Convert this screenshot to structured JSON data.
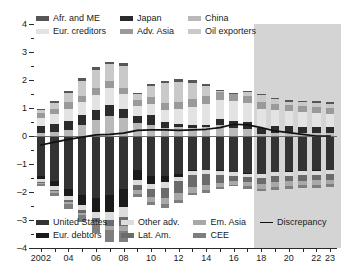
{
  "chart_data": {
    "type": "bar",
    "title": "",
    "subtitle": "",
    "xlabel": "",
    "ylabel": "",
    "grid": false,
    "stacked": true,
    "ylim": [
      -4,
      4
    ],
    "yticks": [
      -4,
      -3,
      -2,
      -1,
      0,
      1,
      2,
      3,
      4
    ],
    "ytick_labels": [
      "–4",
      "–3",
      "–2",
      "–1",
      "0",
      "1",
      "2",
      "3",
      "4"
    ],
    "yminor_ticks": [
      -3.5,
      -2.5,
      -1.5,
      -0.5,
      0.5,
      1.5,
      2.5,
      3.5
    ],
    "x": [
      2002,
      2003,
      2004,
      2005,
      2006,
      2007,
      2008,
      2009,
      2010,
      2011,
      2012,
      2013,
      2014,
      2015,
      2016,
      2017,
      2018,
      2019,
      2020,
      2021,
      2022,
      2023
    ],
    "xtick_labels": [
      "2002",
      "",
      "04",
      "",
      "06",
      "",
      "08",
      "",
      "10",
      "",
      "12",
      "",
      "14",
      "",
      "16",
      "",
      "18",
      "",
      "20",
      "",
      "22",
      "23"
    ],
    "forecast_start": 2017.5,
    "forecast_label": "",
    "series": [
      {
        "name": "China",
        "key": "china",
        "color": "#b9b9b9",
        "side": "positive",
        "values": [
          0.1,
          0.15,
          0.2,
          0.38,
          0.58,
          0.7,
          0.65,
          0.45,
          0.4,
          0.28,
          0.32,
          0.3,
          0.32,
          0.38,
          0.28,
          0.24,
          0.08,
          0.12,
          0.14,
          0.12,
          0.1,
          0.1
        ]
      },
      {
        "name": "Japan",
        "key": "japan",
        "color": "#2b2b2b",
        "side": "positive",
        "values": [
          0.25,
          0.28,
          0.35,
          0.36,
          0.36,
          0.42,
          0.32,
          0.25,
          0.34,
          0.22,
          0.12,
          0.09,
          0.08,
          0.22,
          0.24,
          0.26,
          0.22,
          0.22,
          0.22,
          0.21,
          0.21,
          0.21
        ]
      },
      {
        "name": "Eur. creditors",
        "key": "eur_creditors",
        "color": "#e3e3e3",
        "side": "positive",
        "values": [
          0.28,
          0.34,
          0.42,
          0.46,
          0.52,
          0.58,
          0.52,
          0.36,
          0.4,
          0.44,
          0.52,
          0.66,
          0.74,
          0.7,
          0.72,
          0.68,
          0.66,
          0.58,
          0.54,
          0.52,
          0.5,
          0.48
        ]
      },
      {
        "name": "Adv. Asia",
        "key": "adv_asia",
        "color": "#9a9a9a",
        "side": "positive",
        "values": [
          0.18,
          0.2,
          0.24,
          0.22,
          0.24,
          0.26,
          0.22,
          0.22,
          0.26,
          0.24,
          0.24,
          0.26,
          0.28,
          0.28,
          0.26,
          0.26,
          0.24,
          0.22,
          0.22,
          0.22,
          0.22,
          0.22
        ]
      },
      {
        "name": "Oil exporters",
        "key": "oil_exporters",
        "color": "#c9c9c9",
        "side": "positive",
        "values": [
          0.12,
          0.22,
          0.34,
          0.56,
          0.66,
          0.6,
          0.78,
          0.22,
          0.38,
          0.72,
          0.74,
          0.6,
          0.38,
          0.04,
          0.02,
          0.12,
          0.26,
          0.18,
          0.1,
          0.14,
          0.16,
          0.14
        ]
      },
      {
        "name": "Afr. and ME",
        "key": "afr_me",
        "color": "#565656",
        "side": "positive",
        "values": [
          0.04,
          0.05,
          0.06,
          0.08,
          0.09,
          0.1,
          0.1,
          0.05,
          0.06,
          0.08,
          0.09,
          0.08,
          0.06,
          0.04,
          0.03,
          0.04,
          0.05,
          0.05,
          0.05,
          0.05,
          0.05,
          0.05
        ]
      },
      {
        "name": "United States",
        "key": "united_states",
        "color": "#333333",
        "side": "negative",
        "values": [
          -1.42,
          -1.62,
          -1.88,
          -2.1,
          -2.22,
          -2.1,
          -1.9,
          -1.22,
          -1.42,
          -1.44,
          -1.36,
          -1.22,
          -1.2,
          -1.22,
          -1.28,
          -1.32,
          -1.34,
          -1.28,
          -1.26,
          -1.24,
          -1.22,
          -1.2
        ]
      },
      {
        "name": "Eur. debtors",
        "key": "eur_debtors",
        "color": "#1a1a1a",
        "side": "negative",
        "values": [
          -0.12,
          -0.18,
          -0.26,
          -0.36,
          -0.48,
          -0.6,
          -0.64,
          -0.36,
          -0.28,
          -0.22,
          -0.1,
          -0.02,
          -0.02,
          -0.02,
          -0.02,
          -0.02,
          -0.02,
          -0.02,
          -0.02,
          -0.02,
          -0.02,
          -0.02
        ]
      },
      {
        "name": "Other adv.",
        "key": "other_adv",
        "color": "#dcdcdc",
        "side": "negative",
        "values": [
          -0.1,
          -0.12,
          -0.14,
          -0.18,
          -0.22,
          -0.3,
          -0.34,
          -0.18,
          -0.18,
          -0.18,
          -0.16,
          -0.14,
          -0.14,
          -0.14,
          -0.14,
          -0.14,
          -0.14,
          -0.14,
          -0.14,
          -0.14,
          -0.14,
          -0.14
        ]
      },
      {
        "name": "Lat. Am.",
        "key": "lat_am",
        "color": "#6b6b6b",
        "side": "negative",
        "values": [
          -0.04,
          -0.06,
          -0.08,
          -0.1,
          -0.14,
          -0.22,
          -0.32,
          -0.18,
          -0.3,
          -0.38,
          -0.42,
          -0.44,
          -0.4,
          -0.3,
          -0.18,
          -0.18,
          -0.22,
          -0.22,
          -0.2,
          -0.2,
          -0.2,
          -0.2
        ]
      },
      {
        "name": "Em. Asia",
        "key": "em_asia",
        "color": "#a8a8a8",
        "side": "negative",
        "values": [
          -0.04,
          -0.05,
          -0.06,
          -0.08,
          -0.1,
          -0.14,
          -0.2,
          -0.12,
          -0.16,
          -0.22,
          -0.26,
          -0.22,
          -0.18,
          -0.14,
          -0.12,
          -0.14,
          -0.16,
          -0.16,
          -0.16,
          -0.16,
          -0.16,
          -0.16
        ]
      },
      {
        "name": "CEE",
        "key": "cee",
        "color": "#7e7e7e",
        "side": "negative",
        "values": [
          -0.08,
          -0.12,
          -0.18,
          -0.24,
          -0.32,
          -0.44,
          -0.4,
          -0.12,
          -0.12,
          -0.14,
          -0.1,
          -0.08,
          -0.08,
          -0.06,
          -0.06,
          -0.08,
          -0.1,
          -0.1,
          -0.1,
          -0.1,
          -0.1,
          -0.1
        ]
      }
    ],
    "discrepancy_line": {
      "name": "Discrepancy",
      "color": "#111111",
      "values": [
        -0.32,
        -0.22,
        -0.12,
        -0.04,
        0.04,
        0.06,
        0.1,
        0.2,
        0.22,
        0.22,
        0.2,
        0.22,
        0.24,
        0.3,
        0.42,
        0.4,
        0.3,
        0.18,
        0.12,
        0.06,
        0.0,
        0.0
      ]
    }
  },
  "legend_top": {
    "items": [
      {
        "label": "Afr. and ME",
        "color": "#565656",
        "kind": "swatch"
      },
      {
        "label": "Japan",
        "color": "#2b2b2b",
        "kind": "swatch"
      },
      {
        "label": "China",
        "color": "#b9b9b9",
        "kind": "swatch"
      },
      {
        "label": "Eur. creditors",
        "color": "#e3e3e3",
        "kind": "swatch"
      },
      {
        "label": "Adv. Asia",
        "color": "#9a9a9a",
        "kind": "swatch"
      },
      {
        "label": "Oil exporters",
        "color": "#c9c9c9",
        "kind": "swatch"
      }
    ]
  },
  "legend_bottom": {
    "items": [
      {
        "label": "United States",
        "color": "#333333",
        "kind": "swatch"
      },
      {
        "label": "Other adv.",
        "color": "#dcdcdc",
        "kind": "swatch"
      },
      {
        "label": "Em. Asia",
        "color": "#a8a8a8",
        "kind": "swatch"
      },
      {
        "label": "Discrepancy",
        "color": "#111111",
        "kind": "line"
      },
      {
        "label": "Eur. debtors",
        "color": "#1a1a1a",
        "kind": "swatch"
      },
      {
        "label": "Lat. Am.",
        "color": "#6b6b6b",
        "kind": "swatch"
      },
      {
        "label": "CEE",
        "color": "#7e7e7e",
        "kind": "swatch"
      }
    ]
  },
  "colors": {
    "axis": "#2b2b2b",
    "zero_line": "#6d6d6d",
    "forecast_shade": "#cdcdcd",
    "background": "#ffffff"
  }
}
